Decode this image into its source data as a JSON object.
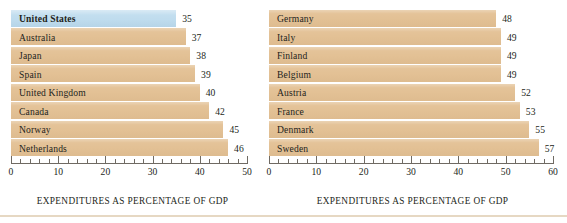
{
  "chart_data": {
    "type": "bar",
    "title": "",
    "orientation": "horizontal",
    "grid": false,
    "legend": null,
    "panels": [
      {
        "name": "left-panel",
        "xlabel": "EXPENDITURES AS PERCENTAGE OF GDP",
        "ylabel": "",
        "xlim": [
          0,
          50
        ],
        "xtick_major_step": 10,
        "xtick_minor_step": 2,
        "xticks": [
          "0",
          "10",
          "20",
          "30",
          "40",
          "50"
        ],
        "categories": [
          "United States",
          "Australia",
          "Japan",
          "Spain",
          "United Kingdom",
          "Canada",
          "Norway",
          "Netherlands"
        ],
        "values": [
          35,
          37,
          38,
          39,
          40,
          42,
          45,
          46
        ],
        "value_labels": [
          "35",
          "37",
          "38",
          "39",
          "40",
          "42",
          "45",
          "46"
        ],
        "highlighted": [
          "United States"
        ]
      },
      {
        "name": "right-panel",
        "xlabel": "EXPENDITURES AS PERCENTAGE OF GDP",
        "ylabel": "",
        "xlim": [
          0,
          60
        ],
        "xtick_major_step": 10,
        "xtick_minor_step": 2,
        "xticks": [
          "0",
          "10",
          "20",
          "30",
          "40",
          "50",
          "60"
        ],
        "categories": [
          "Germany",
          "Italy",
          "Finland",
          "Belgium",
          "Austria",
          "France",
          "Denmark",
          "Sweden"
        ],
        "values": [
          48,
          49,
          49,
          49,
          52,
          53,
          55,
          57
        ],
        "value_labels": [
          "48",
          "49",
          "49",
          "49",
          "52",
          "53",
          "55",
          "57"
        ],
        "highlighted": []
      }
    ],
    "colors": {
      "bar": "#e3c195",
      "bar_highlight": "#bfdcee",
      "text": "#231f20",
      "axis": "#6f6a63",
      "background": "#ffffff",
      "bottom_rule": "#e6d8c3"
    }
  }
}
